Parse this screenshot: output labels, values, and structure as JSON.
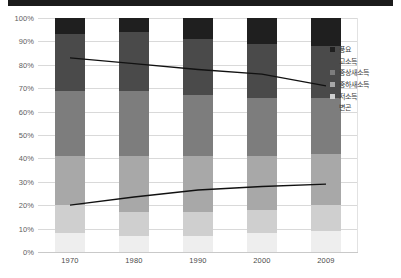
{
  "chart_data": {
    "type": "bar",
    "stacked": true,
    "title": "",
    "subtitle": "",
    "xlabel": "",
    "ylabel": "",
    "categories": [
      "1970",
      "1980",
      "1990",
      "2000",
      "2009"
    ],
    "ylim": [
      0,
      100
    ],
    "ytick_labels": [
      "0%",
      "10%",
      "20%",
      "30%",
      "40%",
      "50%",
      "60%",
      "70%",
      "80%",
      "90%",
      "100%"
    ],
    "ytick_values": [
      0,
      10,
      20,
      30,
      40,
      50,
      60,
      70,
      80,
      90,
      100
    ],
    "grid": true,
    "grid_axis": "y",
    "legend_position": "right",
    "value_unit": "percent",
    "series": [
      {
        "name": "풍요",
        "color": "#1f1f1f",
        "values": [
          7,
          6,
          9,
          11,
          12
        ]
      },
      {
        "name": "고소득",
        "color": "#4a4a4a",
        "values": [
          24,
          25,
          24,
          23,
          22
        ]
      },
      {
        "name": "중상새소득",
        "color": "#7d7d7d",
        "values": [
          28,
          28,
          26,
          25,
          24
        ]
      },
      {
        "name": "중하새소득",
        "color": "#a8a8a8",
        "values": [
          21,
          24,
          24,
          23,
          22
        ]
      },
      {
        "name": "저소득",
        "color": "#cfcfcf",
        "values": [
          12,
          10,
          10,
          10,
          11
        ]
      },
      {
        "name": "변곤",
        "color": "#eeeeee",
        "values": [
          8,
          7,
          7,
          8,
          9
        ]
      }
    ],
    "trend_lines": [
      {
        "name": "upper-trend-line",
        "color": "#111111",
        "x": [
          "1970",
          "1980",
          "1990",
          "2000",
          "2009"
        ],
        "values": [
          83,
          80.5,
          78,
          76,
          71
        ]
      },
      {
        "name": "lower-trend-line",
        "color": "#111111",
        "x": [
          "1970",
          "1980",
          "1990",
          "2000",
          "2009"
        ],
        "values": [
          20,
          23.5,
          26.5,
          28,
          29
        ]
      }
    ]
  },
  "legend": {
    "items": [
      {
        "label": "풍요",
        "color": "#1f1f1f",
        "swatch": true
      },
      {
        "label": "고소득",
        "color": "#4a4a4a",
        "swatch": true
      },
      {
        "label": "중상새소득",
        "color": "#7d7d7d",
        "swatch": true
      },
      {
        "label": "중하새소득",
        "color": "#a8a8a8",
        "swatch": true
      },
      {
        "label": "저소득",
        "color": "#cfcfcf",
        "swatch": true
      },
      {
        "label": "변곤",
        "color": "#ffffff",
        "swatch": false
      }
    ]
  },
  "colors": {
    "grid": "#d9d9d9",
    "axis_text": "#5e5e5e",
    "line": "#111111",
    "top_band": "#1b1b1b",
    "background": "#ffffff"
  }
}
